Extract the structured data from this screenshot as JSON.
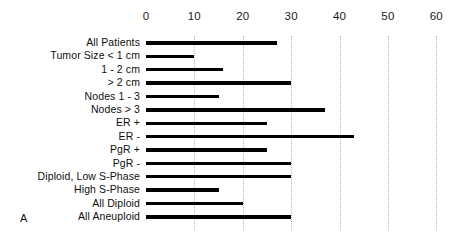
{
  "panel": {
    "letter": "A"
  },
  "chart_data": {
    "type": "bar",
    "orientation": "horizontal",
    "title": "",
    "subtitle": "",
    "xlabel": "",
    "ylabel": "",
    "xlim": [
      0,
      62
    ],
    "ylim": null,
    "grid": true,
    "grid_axis": "x",
    "legend": null,
    "legend_position": "none",
    "bar_color": "#000000",
    "axis_ticks": [
      0,
      10,
      20,
      30,
      40,
      50,
      60
    ],
    "tick_labels": [
      "0",
      "10",
      "20",
      "30",
      "40",
      "50",
      "60"
    ],
    "categories": [
      "All Patients",
      "Tumor Size < 1 cm",
      "1 - 2 cm",
      "> 2 cm",
      "Nodes 1 - 3",
      "Nodes > 3",
      "ER +",
      "ER -",
      "PgR +",
      "PgR -",
      "Diploid, Low S-Phase",
      "High S-Phase",
      "All Diploid",
      "All Aneuploid"
    ],
    "values": [
      27,
      10,
      16,
      30,
      15,
      37,
      25,
      43,
      25,
      30,
      30,
      15,
      20,
      30
    ],
    "annotations": [
      "A"
    ]
  }
}
